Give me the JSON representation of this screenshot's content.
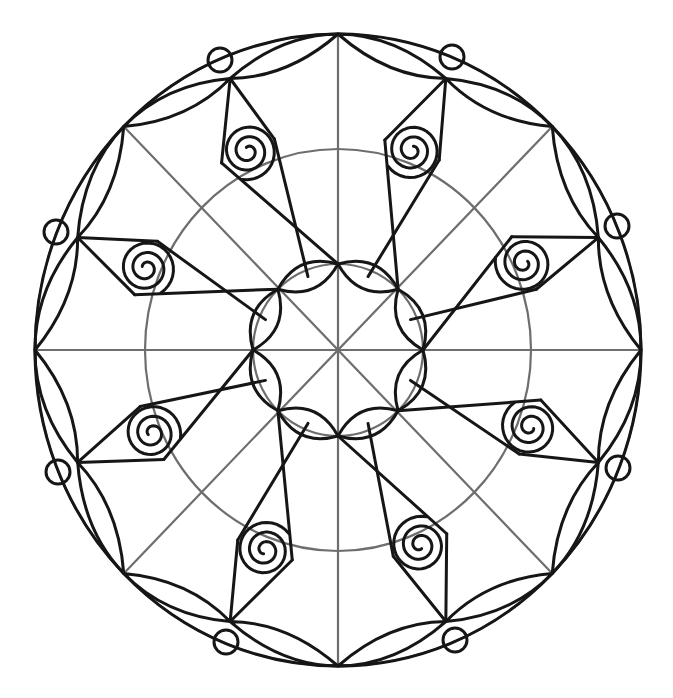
{
  "image": {
    "description": "Black and white mandala coloring page line art with 8-fold symmetry",
    "width": 673,
    "height": 698,
    "background": "#ffffff",
    "ink_color": "#161616",
    "guide_color": "#6e6e6e"
  },
  "geometry": {
    "center": [
      338,
      350
    ],
    "outer_circle": {
      "rx": 303,
      "ry": 316
    },
    "middle_guide_circle": {
      "rx": 193,
      "ry": 201
    },
    "inner_circle": {
      "rx": 85,
      "ry": 86
    },
    "radial_spokes": 8,
    "outer_nodes": 16,
    "inner_nodes": 8,
    "spirals": [
      {
        "cx": 248,
        "cy": 151
      },
      {
        "cx": 412,
        "cy": 150
      },
      {
        "cx": 524,
        "cy": 263
      },
      {
        "cx": 530,
        "cy": 427
      },
      {
        "cx": 420,
        "cy": 545
      },
      {
        "cx": 265,
        "cy": 550
      },
      {
        "cx": 152,
        "cy": 433
      },
      {
        "cx": 146,
        "cy": 268
      }
    ],
    "spiral_radius": 29,
    "small_circles": [
      {
        "cx": 220,
        "cy": 60
      },
      {
        "cx": 452,
        "cy": 57
      },
      {
        "cx": 617,
        "cy": 226
      },
      {
        "cx": 618,
        "cy": 468
      },
      {
        "cx": 455,
        "cy": 640
      },
      {
        "cx": 226,
        "cy": 642
      },
      {
        "cx": 58,
        "cy": 472
      },
      {
        "cx": 56,
        "cy": 232
      }
    ],
    "small_circle_radius": 12
  }
}
